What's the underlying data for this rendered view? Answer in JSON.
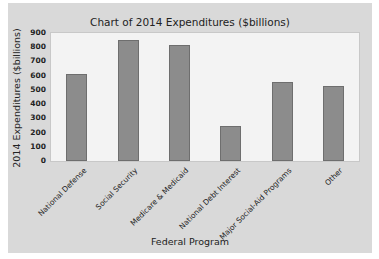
{
  "chart_data": {
    "type": "bar",
    "title": "Chart of 2014 Expenditures ($billions)",
    "xlabel": "Federal Program",
    "ylabel": "2014 Expenditures ($billions)",
    "categories": [
      "National Defense",
      "Social Security",
      "Medicare & Medicaid",
      "National Debt Interest",
      "Major Social-Aid Programs",
      "Other"
    ],
    "values": [
      610,
      850,
      815,
      245,
      555,
      525
    ],
    "ylim": [
      0,
      900
    ],
    "yticks": [
      0,
      100,
      200,
      300,
      400,
      500,
      600,
      700,
      800,
      900
    ],
    "grid": false,
    "legend": null,
    "colors": {
      "bar": "#8c8c8c",
      "panel": "#d9d9d9",
      "plot_bg": "#f3f3f3"
    }
  }
}
